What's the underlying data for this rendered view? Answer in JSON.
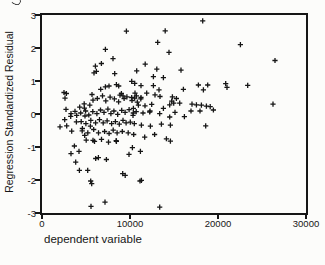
{
  "figure": {
    "background_color": "#fcfcfa",
    "axis_color": "#161616"
  },
  "chart_data": {
    "type": "scatter",
    "title": "",
    "xlabel": "dependent variable",
    "ylabel": "Regression Standardized Residual",
    "xlim": [
      0,
      30000
    ],
    "ylim": [
      -3,
      3
    ],
    "grid": false,
    "legend": "none",
    "marker": "plus",
    "marker_color": "#161616",
    "x_tick_labels": [
      "0",
      "10000",
      "20000",
      "30000"
    ],
    "x_ticks": [
      0,
      10000,
      20000,
      30000
    ],
    "y_tick_labels": [
      "3",
      "2",
      "1",
      "0",
      "-1",
      "-2",
      "-3"
    ],
    "y_ticks": [
      3,
      2,
      1,
      0,
      -1,
      -2,
      -3
    ],
    "points": [
      [
        9590,
        2.51
      ],
      [
        7200,
        1.96
      ],
      [
        8070,
        1.68
      ],
      [
        6070,
        1.45
      ],
      [
        6750,
        1.53
      ],
      [
        6180,
        1.29
      ],
      [
        5910,
        1.25
      ],
      [
        8260,
        1.22
      ],
      [
        11730,
        1.51
      ],
      [
        10760,
        1.31
      ],
      [
        10190,
        0.99
      ],
      [
        10530,
        0.93
      ],
      [
        7200,
        0.82
      ],
      [
        7610,
        0.85
      ],
      [
        6670,
        0.75
      ],
      [
        5680,
        0.59
      ],
      [
        2500,
        0.65
      ],
      [
        2770,
        0.62
      ],
      [
        8450,
        0.89
      ],
      [
        8720,
        0.85
      ],
      [
        9020,
        0.62
      ],
      [
        8860,
        0.57
      ],
      [
        9200,
        0.55
      ],
      [
        10730,
        0.55
      ],
      [
        10530,
        0.48
      ],
      [
        18260,
        2.82
      ],
      [
        14000,
        2.52
      ],
      [
        13150,
        2.17
      ],
      [
        14430,
        1.87
      ],
      [
        13040,
        1.36
      ],
      [
        15800,
        1.33
      ],
      [
        12660,
        1.13
      ],
      [
        13800,
        1.1
      ],
      [
        11250,
        0.86
      ],
      [
        12660,
        0.86
      ],
      [
        13300,
        0.73
      ],
      [
        11900,
        0.63
      ],
      [
        12840,
        0.58
      ],
      [
        13410,
        0.53
      ],
      [
        14740,
        0.39
      ],
      [
        16070,
        0.75
      ],
      [
        17770,
        0.88
      ],
      [
        18340,
        0.73
      ],
      [
        18830,
        0.88
      ],
      [
        17050,
        0.3
      ],
      [
        18110,
        0.27
      ],
      [
        19110,
        0.22
      ],
      [
        16930,
        0.09
      ],
      [
        17950,
        0.09
      ],
      [
        19480,
        0.12
      ],
      [
        22550,
        2.1
      ],
      [
        26480,
        1.62
      ],
      [
        20880,
        0.92
      ],
      [
        21020,
        0.81
      ],
      [
        23380,
        0.87
      ],
      [
        26250,
        0.3
      ],
      [
        14820,
        0.52
      ],
      [
        15270,
        0.47
      ],
      [
        14510,
        0.28
      ],
      [
        14970,
        0.33
      ],
      [
        15650,
        0.33
      ],
      [
        17550,
        0.28
      ],
      [
        18680,
        0.24
      ],
      [
        16180,
        -0.08
      ],
      [
        18600,
        -0.36
      ],
      [
        14510,
        -0.09
      ],
      [
        10340,
        -0.04
      ],
      [
        11480,
        0.03
      ],
      [
        12240,
        0.06
      ],
      [
        13370,
        0.01
      ],
      [
        11290,
        -0.34
      ],
      [
        12320,
        -0.37
      ],
      [
        13570,
        -0.31
      ],
      [
        14590,
        -0.34
      ],
      [
        10420,
        -0.62
      ],
      [
        11670,
        -0.7
      ],
      [
        12800,
        -0.62
      ],
      [
        14140,
        -0.75
      ],
      [
        14590,
        -0.82
      ],
      [
        10270,
        -1.02
      ],
      [
        11180,
        -1.13
      ],
      [
        11290,
        -2.01
      ],
      [
        13370,
        -2.82
      ],
      [
        3830,
        -1.46
      ],
      [
        6100,
        -1.35
      ],
      [
        6410,
        -1.32
      ],
      [
        9890,
        -1.22
      ],
      [
        4250,
        -1.71
      ],
      [
        5190,
        -1.71
      ],
      [
        5530,
        -2.03
      ],
      [
        5650,
        -2.11
      ],
      [
        9170,
        -1.81
      ],
      [
        9450,
        -1.86
      ],
      [
        11140,
        -2.03
      ],
      [
        5570,
        -2.8
      ],
      [
        7160,
        -2.67
      ],
      [
        2610,
        0.48
      ],
      [
        2730,
        0.14
      ],
      [
        3750,
        0.08
      ],
      [
        4820,
        0.18
      ],
      [
        3300,
        0.01
      ],
      [
        3940,
        -0.04
      ],
      [
        4890,
        -0.06
      ],
      [
        2810,
        -0.36
      ],
      [
        2050,
        -0.39
      ],
      [
        4590,
        -0.44
      ],
      [
        3680,
        -0.97
      ],
      [
        4200,
        -1.13
      ],
      [
        3300,
        -1.2
      ],
      [
        7320,
        -1.38
      ],
      [
        8460,
        -0.83
      ],
      [
        2580,
        -0.17
      ],
      [
        3260,
        -0.07
      ],
      [
        3910,
        -0.24
      ],
      [
        3380,
        -0.52
      ],
      [
        4850,
        -0.65
      ],
      [
        5500,
        -0.37
      ],
      [
        5800,
        -0.8
      ],
      [
        15110,
        0.05
      ],
      [
        13800,
        0.17
      ],
      [
        12270,
        0.09
      ],
      [
        11700,
        0.25
      ],
      [
        12470,
        0.29
      ],
      [
        10950,
        0.27
      ],
      [
        10390,
        0.17
      ],
      [
        10570,
        0.63
      ],
      [
        11250,
        0.5
      ],
      [
        10190,
        0.5
      ],
      [
        4280,
        0.21
      ],
      [
        4790,
        0.31
      ],
      [
        5430,
        0.27
      ],
      [
        5800,
        0.42
      ],
      [
        6280,
        0.47
      ],
      [
        6870,
        0.55
      ],
      [
        7250,
        0.4
      ],
      [
        7740,
        0.51
      ],
      [
        8230,
        0.46
      ],
      [
        8710,
        0.37
      ],
      [
        9330,
        0.47
      ],
      [
        9650,
        0.52
      ],
      [
        10230,
        0.41
      ],
      [
        10830,
        0.36
      ],
      [
        11230,
        0.46
      ],
      [
        4400,
        0.03
      ],
      [
        4950,
        0.09
      ],
      [
        5320,
        -0.03
      ],
      [
        5770,
        0.07
      ],
      [
        6240,
        0.01
      ],
      [
        6650,
        0.12
      ],
      [
        7050,
        0.05
      ],
      [
        7490,
        0.15
      ],
      [
        7830,
        0.01
      ],
      [
        8170,
        0.09
      ],
      [
        8600,
        -0.01
      ],
      [
        9060,
        0.11
      ],
      [
        9440,
        0.05
      ],
      [
        9900,
        0.13
      ],
      [
        10370,
        0.03
      ],
      [
        10710,
        0.07
      ],
      [
        4460,
        -0.23
      ],
      [
        4990,
        -0.29
      ],
      [
        5540,
        -0.19
      ],
      [
        6090,
        -0.27
      ],
      [
        6530,
        -0.17
      ],
      [
        6960,
        -0.27
      ],
      [
        7400,
        -0.21
      ],
      [
        7910,
        -0.29
      ],
      [
        8340,
        -0.23
      ],
      [
        8780,
        -0.31
      ],
      [
        9200,
        -0.19
      ],
      [
        9560,
        -0.27
      ],
      [
        10030,
        -0.25
      ],
      [
        10490,
        -0.29
      ],
      [
        4570,
        -0.51
      ],
      [
        5210,
        -0.57
      ],
      [
        5880,
        -0.47
      ],
      [
        6420,
        -0.57
      ],
      [
        7110,
        -0.53
      ],
      [
        7630,
        -0.59
      ],
      [
        8090,
        -0.49
      ],
      [
        8530,
        -0.57
      ],
      [
        9120,
        -0.53
      ],
      [
        9790,
        -0.57
      ],
      [
        5020,
        -0.79
      ],
      [
        5970,
        -0.83
      ],
      [
        6760,
        -0.77
      ],
      [
        7560,
        -0.85
      ],
      [
        8430,
        -0.81
      ]
    ]
  }
}
